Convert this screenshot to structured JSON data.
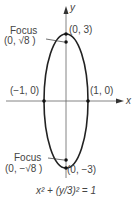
{
  "diagram": {
    "axis_labels": {
      "x": "x",
      "y": "y"
    },
    "points": {
      "top_vertex": "(0, 3)",
      "bottom_vertex": "(0, −3)",
      "left_vertex": "(−1, 0)",
      "right_vertex": "(1, 0)"
    },
    "foci": {
      "upper": {
        "title": "Focus",
        "coords": "(0, √8 )"
      },
      "lower": {
        "title": "Focus",
        "coords": "(0, −√8 )"
      }
    },
    "equation": "x² + (y/3)² = 1",
    "colors": {
      "curve": "#222222",
      "axis": "#555555",
      "text": "#444444"
    }
  }
}
